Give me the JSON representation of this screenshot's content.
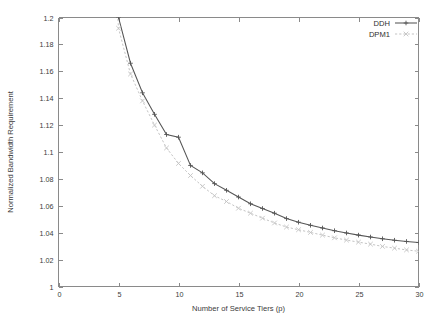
{
  "chart_data": {
    "type": "line",
    "title": "",
    "xlabel": "Number of Service Tiers (p)",
    "ylabel": "Normalized Bandwidth Requirement",
    "xlim": [
      0,
      30
    ],
    "ylim": [
      1,
      1.2
    ],
    "xticks": [
      0,
      5,
      10,
      15,
      20,
      25,
      30
    ],
    "xtick_labels": [
      "0",
      "5",
      "10",
      "15",
      "20",
      "25",
      "30"
    ],
    "yticks": [
      1,
      1.02,
      1.04,
      1.06,
      1.08,
      1.1,
      1.12,
      1.14,
      1.16,
      1.18,
      1.2
    ],
    "ytick_labels": [
      "1",
      "1.02",
      "1.04",
      "1.06",
      "1.08",
      "1.1",
      "1.12",
      "1.14",
      "1.16",
      "1.18",
      "1.2"
    ],
    "grid": false,
    "legend_position": "top-right",
    "x": [
      5,
      6,
      7,
      8,
      9,
      10,
      11,
      12,
      13,
      14,
      15,
      16,
      17,
      18,
      19,
      20,
      21,
      22,
      23,
      24,
      25,
      26,
      27,
      28,
      29,
      30
    ],
    "series": [
      {
        "name": "DDH",
        "color": "#555555",
        "line_style": "solid",
        "marker": "plus",
        "values": [
          1.2,
          1.166,
          1.144,
          1.128,
          1.113,
          1.111,
          1.09,
          1.0845,
          1.0765,
          1.0715,
          1.0665,
          1.0615,
          1.058,
          1.0545,
          1.0505,
          1.0478,
          1.0455,
          1.0435,
          1.0415,
          1.0398,
          1.0382,
          1.0368,
          1.0355,
          1.0344,
          1.0335,
          1.0327
        ]
      },
      {
        "name": "DPM1",
        "color": "#c3c3c3",
        "line_style": "dotted",
        "marker": "cross",
        "values": [
          1.192,
          1.158,
          1.138,
          1.12,
          1.103,
          1.0915,
          1.0825,
          1.0745,
          1.0675,
          1.0632,
          1.0582,
          1.0545,
          1.0508,
          1.0472,
          1.0442,
          1.0422,
          1.0402,
          1.0382,
          1.0362,
          1.0345,
          1.033,
          1.0315,
          1.0298,
          1.0285,
          1.0272,
          1.0262
        ]
      }
    ]
  },
  "legend": {
    "entries": [
      {
        "label": "DDH"
      },
      {
        "label": "DPM1"
      }
    ]
  },
  "axes": {
    "x_title": "Number of Service Tiers (p)",
    "y_title": "Normalized Bandwidth Requirement"
  }
}
